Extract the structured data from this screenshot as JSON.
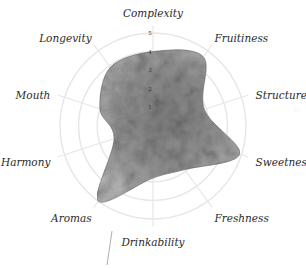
{
  "chart_data": {
    "type": "radar",
    "title": "",
    "axes": [
      "Complexity",
      "Fruitiness",
      "Structure",
      "Sweetness",
      "Freshness",
      "Drinkability",
      "Aromas",
      "Harmony",
      "Mouth",
      "Longevity"
    ],
    "series": [
      {
        "name": "Profile",
        "values": [
          4.0,
          4.6,
          2.9,
          4.9,
          2.9,
          2.8,
          5.0,
          2.2,
          3.0,
          3.9
        ]
      }
    ],
    "rlim": [
      0,
      5
    ],
    "ticks": [
      "1",
      "2",
      "3",
      "4",
      "5"
    ],
    "grid": true,
    "legend": "none",
    "colors": {
      "fill": "#8a8a8a",
      "grid": "#e6e6e6",
      "text": "#2a2a2a"
    }
  }
}
